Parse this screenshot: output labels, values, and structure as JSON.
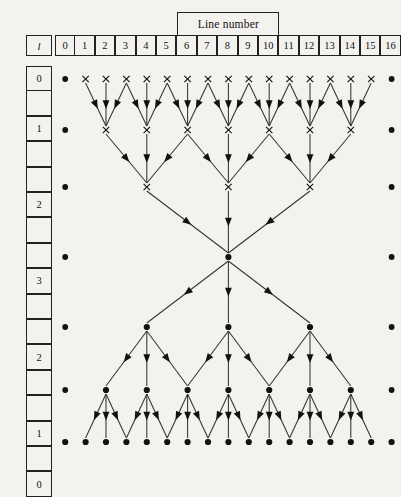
{
  "figure": {
    "title_box": {
      "label": "Line number",
      "spans_columns": [
        6,
        7,
        8,
        9,
        10
      ]
    },
    "level_header": {
      "label": "l"
    },
    "line_numbers": [
      "0",
      "1",
      "2",
      "3",
      "4",
      "5",
      "6",
      "7",
      "8",
      "9",
      "10",
      "11",
      "12",
      "13",
      "14",
      "15",
      "16"
    ],
    "level_boxes": [
      {
        "label": "0",
        "row": 0
      },
      {
        "label": "",
        "row": null
      },
      {
        "label": "1",
        "row": 1
      },
      {
        "label": "",
        "row": null
      },
      {
        "label": "",
        "row": null
      },
      {
        "label": "2",
        "row": 2
      },
      {
        "label": "",
        "row": null
      },
      {
        "label": "",
        "row": null
      },
      {
        "label": "3",
        "row": 3
      },
      {
        "label": "",
        "row": null
      },
      {
        "label": "",
        "row": null
      },
      {
        "label": "2",
        "row": 4
      },
      {
        "label": "",
        "row": null
      },
      {
        "label": "",
        "row": null
      },
      {
        "label": "1",
        "row": 5
      },
      {
        "label": "",
        "row": null
      },
      {
        "label": "0",
        "row": 6
      }
    ],
    "colors": {
      "background": "#f4f2ee",
      "ink": "#111111",
      "edge": "#333333",
      "box_border": "#222222"
    }
  },
  "chart_data": {
    "type": "diagram",
    "title": "Line number",
    "xlabel": "Line number",
    "ylabel": "l",
    "columns": [
      0,
      1,
      2,
      3,
      4,
      5,
      6,
      7,
      8,
      9,
      10,
      11,
      12,
      13,
      14,
      15,
      16
    ],
    "rows": [
      {
        "index": 0,
        "level": "0",
        "phase": "reduce",
        "marker": "x",
        "active_columns": [
          1,
          2,
          3,
          4,
          5,
          6,
          7,
          8,
          9,
          10,
          11,
          12,
          13,
          14,
          15
        ],
        "endpoint_columns": [
          0,
          16
        ]
      },
      {
        "index": 1,
        "level": "1",
        "phase": "reduce",
        "marker": "x",
        "active_columns": [
          2,
          4,
          6,
          8,
          10,
          12,
          14
        ],
        "endpoint_columns": [
          0,
          16
        ]
      },
      {
        "index": 2,
        "level": "2",
        "phase": "reduce",
        "marker": "x",
        "active_columns": [
          4,
          8,
          12
        ],
        "endpoint_columns": [
          0,
          16
        ]
      },
      {
        "index": 3,
        "level": "3",
        "phase": "apex",
        "marker": "dot",
        "active_columns": [
          8
        ],
        "endpoint_columns": [
          0,
          16
        ]
      },
      {
        "index": 4,
        "level": "2",
        "phase": "broadcast",
        "marker": "dot",
        "active_columns": [
          4,
          8,
          12
        ],
        "endpoint_columns": [
          0,
          16
        ]
      },
      {
        "index": 5,
        "level": "1",
        "phase": "broadcast",
        "marker": "dot",
        "active_columns": [
          2,
          4,
          6,
          8,
          10,
          12,
          14
        ],
        "endpoint_columns": [
          0,
          16
        ]
      },
      {
        "index": 6,
        "level": "0",
        "phase": "broadcast",
        "marker": "dot",
        "active_columns": [
          0,
          1,
          2,
          3,
          4,
          5,
          6,
          7,
          8,
          9,
          10,
          11,
          12,
          13,
          14,
          15,
          16
        ],
        "endpoint_columns": []
      }
    ],
    "edges_reduce": [
      {
        "from_row": 0,
        "to_row": 1,
        "pairs": [
          [
            1,
            2
          ],
          [
            2,
            2
          ],
          [
            3,
            2
          ],
          [
            3,
            4
          ],
          [
            4,
            4
          ],
          [
            5,
            4
          ],
          [
            5,
            6
          ],
          [
            6,
            6
          ],
          [
            7,
            6
          ],
          [
            7,
            8
          ],
          [
            8,
            8
          ],
          [
            9,
            8
          ],
          [
            9,
            10
          ],
          [
            10,
            10
          ],
          [
            11,
            10
          ],
          [
            11,
            12
          ],
          [
            12,
            12
          ],
          [
            13,
            12
          ],
          [
            13,
            14
          ],
          [
            14,
            14
          ],
          [
            15,
            14
          ]
        ]
      },
      {
        "from_row": 1,
        "to_row": 2,
        "pairs": [
          [
            2,
            4
          ],
          [
            4,
            4
          ],
          [
            6,
            4
          ],
          [
            6,
            8
          ],
          [
            8,
            8
          ],
          [
            10,
            8
          ],
          [
            10,
            12
          ],
          [
            12,
            12
          ],
          [
            14,
            12
          ]
        ]
      },
      {
        "from_row": 2,
        "to_row": 3,
        "pairs": [
          [
            4,
            8
          ],
          [
            8,
            8
          ],
          [
            12,
            8
          ]
        ]
      }
    ],
    "edges_broadcast": [
      {
        "from_row": 3,
        "to_row": 4,
        "pairs": [
          [
            8,
            4
          ],
          [
            8,
            8
          ],
          [
            8,
            12
          ]
        ]
      },
      {
        "from_row": 4,
        "to_row": 5,
        "pairs": [
          [
            4,
            2
          ],
          [
            4,
            4
          ],
          [
            4,
            6
          ],
          [
            8,
            6
          ],
          [
            8,
            8
          ],
          [
            8,
            10
          ],
          [
            12,
            10
          ],
          [
            12,
            12
          ],
          [
            12,
            14
          ]
        ]
      },
      {
        "from_row": 5,
        "to_row": 6,
        "pairs": [
          [
            2,
            1
          ],
          [
            2,
            2
          ],
          [
            2,
            3
          ],
          [
            4,
            3
          ],
          [
            4,
            4
          ],
          [
            4,
            5
          ],
          [
            6,
            5
          ],
          [
            6,
            6
          ],
          [
            6,
            7
          ],
          [
            8,
            7
          ],
          [
            8,
            8
          ],
          [
            8,
            9
          ],
          [
            10,
            9
          ],
          [
            10,
            10
          ],
          [
            10,
            11
          ],
          [
            12,
            11
          ],
          [
            12,
            12
          ],
          [
            12,
            13
          ],
          [
            14,
            13
          ],
          [
            14,
            14
          ],
          [
            14,
            15
          ]
        ]
      }
    ],
    "geometry": {
      "grid_left": 55,
      "grid_right": 382,
      "col_step": 20.4,
      "row_y": [
        79,
        130,
        187,
        257,
        327,
        390,
        442
      ]
    }
  }
}
